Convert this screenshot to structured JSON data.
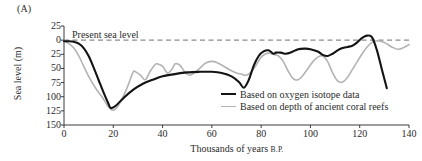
{
  "panel": {
    "label": "(A)"
  },
  "axes": {
    "ylabel": "Sea level (m)",
    "xlabel_main": "Thousands of years",
    "xlabel_suffix": "B.P.",
    "yticks": [
      "25",
      "0",
      "25",
      "50",
      "75",
      "100",
      "125",
      "150"
    ],
    "xticks": [
      "0",
      "20",
      "40",
      "60",
      "80",
      "100",
      "120",
      "140"
    ]
  },
  "annotations": {
    "present_sea_level": "Present sea level"
  },
  "legend": {
    "items": [
      {
        "label": "Based on oxygen isotope data",
        "color": "#141414",
        "style": "solid-thick"
      },
      {
        "label": "Based on depth of ancient coral reefs",
        "color": "#b3b3b3",
        "style": "solid-thin"
      }
    ]
  },
  "colors": {
    "oxygen_isotope": "#141414",
    "coral_reefs": "#b3b3b3",
    "axis": "#3a3a3a",
    "present_level_dash": "#8c8c8c",
    "background": "#ffffff"
  },
  "chart_data": {
    "type": "line",
    "title": "",
    "subtitle": "",
    "xlabel": "Thousands of years B.P.",
    "ylabel": "Sea level (m)",
    "xlim": [
      0,
      140
    ],
    "ylim": [
      -25,
      150
    ],
    "y_axis_inverted": true,
    "y_axis_note": "Values are metres below present sea level; -25 plots above the zero (present sea level) line.",
    "grid": false,
    "legend_position": "inside-lower-right",
    "reference_lines": [
      {
        "label": "Present sea level",
        "y": 0,
        "style": "dashed",
        "color": "#8c8c8c"
      }
    ],
    "series": [
      {
        "name": "Based on oxygen isotope data",
        "color": "#141414",
        "x": [
          0,
          2,
          4,
          6,
          8,
          10,
          12,
          14,
          16,
          18,
          19,
          21,
          24,
          28,
          32,
          36,
          40,
          45,
          50,
          55,
          60,
          64,
          68,
          71,
          73,
          75,
          77,
          79,
          81,
          83,
          85,
          86,
          88,
          90,
          92,
          95,
          98,
          100,
          103,
          105,
          107,
          109,
          111,
          113,
          115,
          117,
          119,
          121,
          123,
          125,
          127,
          129,
          131
        ],
        "y": [
          2,
          2,
          3,
          6,
          14,
          28,
          48,
          70,
          92,
          112,
          120,
          116,
          103,
          88,
          77,
          70,
          64,
          60,
          57,
          56,
          56,
          58,
          64,
          74,
          84,
          70,
          45,
          28,
          20,
          18,
          24,
          22,
          22,
          24,
          22,
          16,
          15,
          16,
          20,
          26,
          28,
          24,
          18,
          14,
          12,
          10,
          4,
          -4,
          -8,
          -5,
          18,
          52,
          85
        ]
      },
      {
        "name": "Based on depth of ancient coral reefs",
        "color": "#b3b3b3",
        "x": [
          0,
          2,
          4,
          6,
          8,
          10,
          13,
          16,
          18,
          20,
          22,
          24,
          26,
          28,
          29,
          31,
          33,
          35,
          37,
          38,
          40,
          42,
          44,
          45,
          47,
          49,
          51,
          54,
          57,
          59,
          61,
          64,
          67,
          70,
          72,
          74,
          76,
          78,
          80,
          82,
          83,
          85,
          87,
          89,
          91,
          93,
          95,
          97,
          99,
          101,
          103,
          105,
          107,
          109,
          111,
          113,
          115,
          117,
          119,
          121,
          123,
          125,
          127,
          130,
          133,
          136,
          140
        ],
        "y": [
          2,
          6,
          14,
          28,
          46,
          64,
          86,
          104,
          118,
          124,
          116,
          100,
          80,
          57,
          56,
          62,
          70,
          55,
          43,
          42,
          46,
          58,
          50,
          42,
          44,
          56,
          62,
          54,
          42,
          38,
          38,
          44,
          52,
          58,
          60,
          62,
          56,
          44,
          30,
          24,
          23,
          25,
          28,
          38,
          55,
          68,
          70,
          62,
          50,
          38,
          30,
          28,
          38,
          58,
          72,
          74,
          66,
          52,
          38,
          24,
          12,
          4,
          1,
          4,
          12,
          16,
          8
        ]
      }
    ]
  }
}
